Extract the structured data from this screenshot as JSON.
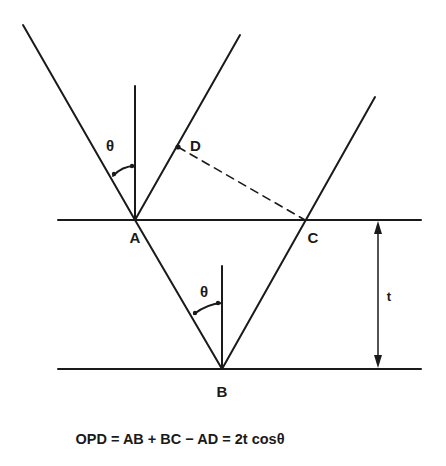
{
  "diagram": {
    "type": "thin-film-interference",
    "colors": {
      "ink": "#1a1a1a",
      "background": "#ffffff"
    },
    "labels": {
      "A": "A",
      "B": "B",
      "C": "C",
      "D": "D",
      "theta_top": "θ",
      "theta_bottom": "θ",
      "thickness": "t"
    },
    "equation": "OPD = AB + BC − AD = 2t cosθ"
  }
}
